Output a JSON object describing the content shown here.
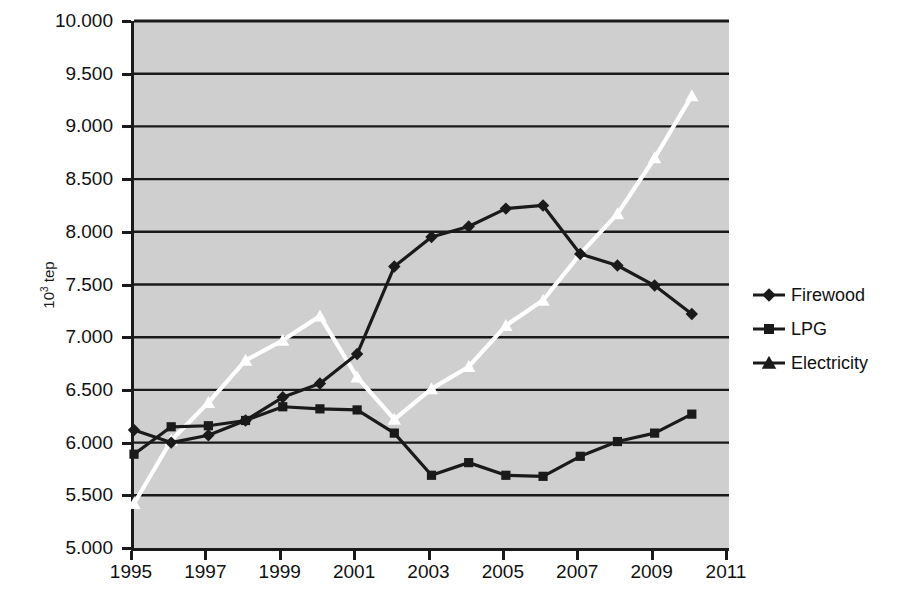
{
  "chart_data": {
    "type": "line",
    "title": "",
    "xlabel": "",
    "ylabel": "10³ tep",
    "ylabel_base": "10",
    "ylabel_exp": "3",
    "ylabel_unit": " tep",
    "x": [
      1995,
      1996,
      1997,
      1998,
      1999,
      2000,
      2001,
      2002,
      2003,
      2004,
      2005,
      2006,
      2007,
      2008,
      2009,
      2010
    ],
    "xlim": [
      1995,
      2011
    ],
    "ylim": [
      5000,
      10000
    ],
    "grid": true,
    "legend_position": "right",
    "y_tick_values": [
      5000,
      5500,
      6000,
      6500,
      7000,
      7500,
      8000,
      8500,
      9000,
      9500,
      10000
    ],
    "y_tick_labels": [
      "5.000",
      "5.500",
      "6.000",
      "6.500",
      "7.000",
      "7.500",
      "8.000",
      "8.500",
      "9.000",
      "9.500",
      "10.000"
    ],
    "x_tick_values": [
      1995,
      1997,
      1999,
      2001,
      2003,
      2005,
      2007,
      2009,
      2011
    ],
    "x_tick_labels": [
      "1995",
      "1997",
      "1999",
      "2001",
      "2003",
      "2005",
      "2007",
      "2009",
      "2011"
    ],
    "series": [
      {
        "name": "Firewood",
        "marker": "diamond",
        "color": "#1a1a1a",
        "values": [
          6120,
          6000,
          6070,
          6210,
          6430,
          6560,
          6840,
          7670,
          7950,
          8050,
          8220,
          8250,
          7790,
          7680,
          7490,
          7220
        ]
      },
      {
        "name": "LPG",
        "marker": "square",
        "color": "#1a1a1a",
        "values": [
          5890,
          6150,
          6160,
          6210,
          6340,
          6320,
          6310,
          6090,
          5690,
          5810,
          5690,
          5680,
          5870,
          6010,
          6090,
          6270
        ]
      },
      {
        "name": "Electricity",
        "marker": "triangle",
        "color": "#ffffff",
        "values": [
          5420,
          6020,
          6380,
          6780,
          6970,
          7200,
          6620,
          6220,
          6510,
          6720,
          7110,
          7350,
          7790,
          8170,
          8700,
          9290
        ]
      }
    ]
  },
  "legend": {
    "items": [
      {
        "label": "Firewood"
      },
      {
        "label": "LPG"
      },
      {
        "label": "Electricity"
      }
    ]
  },
  "style": {
    "plot_background": "#cfcfcf",
    "axis_color": "#1a1a1a",
    "gridline_color": "#1a1a1a",
    "page_background": "#ffffff"
  }
}
